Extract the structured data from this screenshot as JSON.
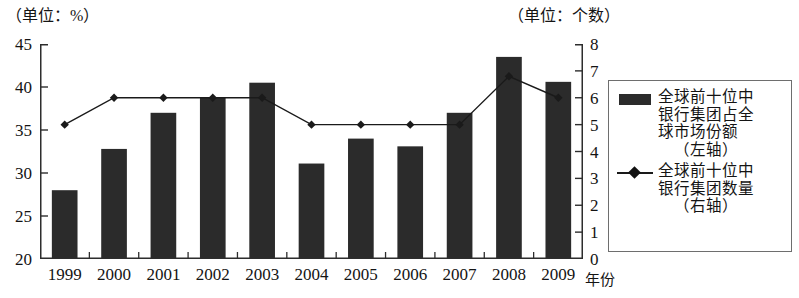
{
  "axes": {
    "left_unit_caption": "（单位：%）",
    "right_unit_caption": "（单位：个数）",
    "x_axis_title": "年份"
  },
  "legend": {
    "entries": [
      {
        "key": "bar-swatch",
        "line1": "全球前十位中",
        "line2": "银行集团占全",
        "line3": "球市场份额",
        "line4": "（左轴）"
      },
      {
        "key": "line-marker-swatch",
        "line1": "全球前十位中",
        "line2": "银行集团数量",
        "line3": "（右轴）"
      }
    ]
  },
  "chart_data": {
    "type": "bar",
    "title": "",
    "subtitle": "",
    "xlabel": "年份",
    "ylabel": "（单位：%）",
    "y2label": "（单位：个数）",
    "grid": false,
    "legend_position": "right",
    "categories": [
      "1999",
      "2000",
      "2001",
      "2002",
      "2003",
      "2004",
      "2005",
      "2006",
      "2007",
      "2008",
      "2009"
    ],
    "ylim": [
      20,
      45
    ],
    "yticks": [
      20,
      25,
      30,
      35,
      40,
      45
    ],
    "y2lim": [
      0,
      8
    ],
    "y2ticks": [
      0,
      1,
      2,
      3,
      4,
      5,
      6,
      7,
      8
    ],
    "series": [
      {
        "name": "全球前十位中银行集团占全球市场份额（左轴）",
        "type": "bar",
        "axis": "left",
        "color": "#2b2b2b",
        "values": [
          28.0,
          32.8,
          37.0,
          38.8,
          40.5,
          31.1,
          34.0,
          33.1,
          37.0,
          43.5,
          40.6
        ]
      },
      {
        "name": "全球前十位中银行集团数量（右轴）",
        "type": "line",
        "axis": "right",
        "color": "#1a1a1a",
        "marker": "diamond",
        "values": [
          5.0,
          6.0,
          6.0,
          6.0,
          6.0,
          5.0,
          5.0,
          5.0,
          5.0,
          6.8,
          6.0
        ]
      }
    ]
  }
}
